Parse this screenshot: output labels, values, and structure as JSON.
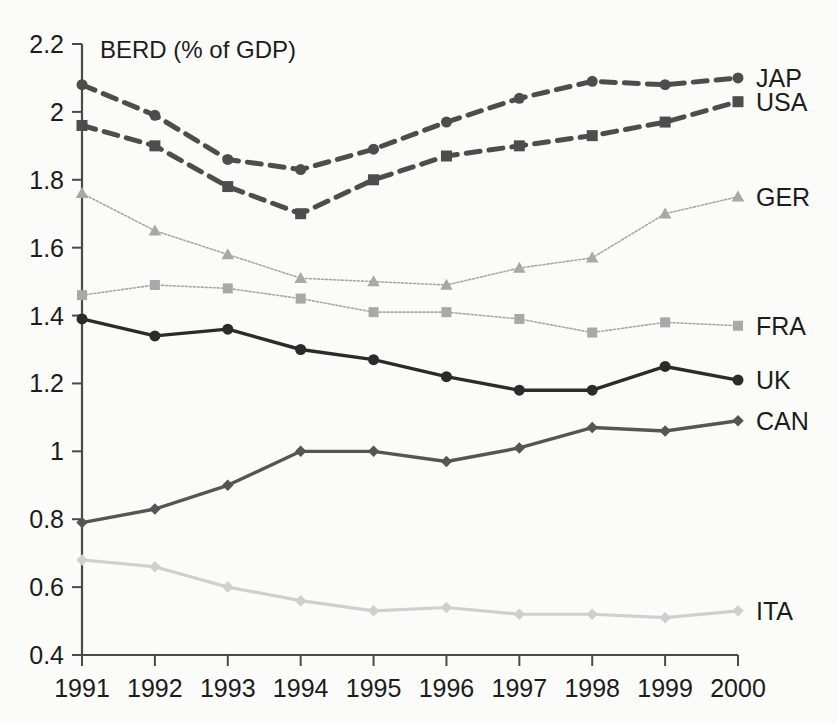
{
  "chart_data": {
    "type": "line",
    "title": "BERD (% of GDP)",
    "xlabel": "",
    "ylabel": "",
    "categories": [
      "1991",
      "1992",
      "1993",
      "1994",
      "1995",
      "1996",
      "1997",
      "1998",
      "1999",
      "2000"
    ],
    "x": [
      1991,
      1992,
      1993,
      1994,
      1995,
      1996,
      1997,
      1998,
      1999,
      2000
    ],
    "ylim": [
      0.4,
      2.2
    ],
    "yticks": [
      "0.4",
      "0.6",
      "0.8",
      "1",
      "1.2",
      "1.4",
      "1.6",
      "1.8",
      "2",
      "2.2"
    ],
    "ytick_values": [
      0.4,
      0.6,
      0.8,
      1.0,
      1.2,
      1.4,
      1.6,
      1.8,
      2.0,
      2.2
    ],
    "grid": false,
    "legend_position": "right-inline-end-of-series",
    "series": [
      {
        "name": "JAP",
        "label": "JAP",
        "values": [
          2.08,
          1.99,
          1.86,
          1.83,
          1.89,
          1.97,
          2.04,
          2.09,
          2.08,
          2.1
        ],
        "color": "#4d4d4d",
        "marker": "circle",
        "dash": "14,9",
        "width": 5
      },
      {
        "name": "USA",
        "label": "USA",
        "values": [
          1.96,
          1.9,
          1.78,
          1.7,
          1.8,
          1.87,
          1.9,
          1.93,
          1.97,
          2.03
        ],
        "color": "#4d4d4d",
        "marker": "square",
        "dash": "14,9",
        "width": 5
      },
      {
        "name": "GER",
        "label": "GER",
        "values": [
          1.76,
          1.65,
          1.58,
          1.51,
          1.5,
          1.49,
          1.54,
          1.57,
          1.7,
          1.75
        ],
        "color": "#a8a8a8",
        "marker": "triangle",
        "dash": "2,2",
        "width": 1.6
      },
      {
        "name": "FRA",
        "label": "FRA",
        "values": [
          1.46,
          1.49,
          1.48,
          1.45,
          1.41,
          1.41,
          1.39,
          1.35,
          1.38,
          1.37
        ],
        "color": "#a8a8a8",
        "marker": "square",
        "dash": "2,2",
        "width": 1.6
      },
      {
        "name": "UK",
        "label": "UK",
        "values": [
          1.39,
          1.34,
          1.36,
          1.3,
          1.27,
          1.22,
          1.18,
          1.18,
          1.25,
          1.21
        ],
        "color": "#2b2b2b",
        "marker": "circle",
        "dash": "none",
        "width": 3.4
      },
      {
        "name": "CAN",
        "label": "CAN",
        "values": [
          0.79,
          0.83,
          0.9,
          1.0,
          1.0,
          0.97,
          1.01,
          1.07,
          1.06,
          1.09
        ],
        "color": "#555555",
        "marker": "diamond",
        "dash": "none",
        "width": 3.4
      },
      {
        "name": "ITA",
        "label": "ITA",
        "values": [
          0.68,
          0.66,
          0.6,
          0.56,
          0.53,
          0.54,
          0.52,
          0.52,
          0.51,
          0.53
        ],
        "color": "#cfcfcf",
        "marker": "diamond",
        "dash": "none",
        "width": 3.2
      }
    ]
  }
}
